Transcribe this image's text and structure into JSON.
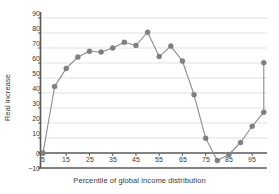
{
  "chart_data": {
    "type": "line",
    "title": "",
    "xlabel": "Percentile of global income distribution",
    "ylabel": "Real increase",
    "xlim": [
      3,
      102
    ],
    "ylim": [
      -10,
      90
    ],
    "yticks": [
      90,
      80,
      70,
      60,
      50,
      40,
      30,
      20,
      10,
      0,
      -10
    ],
    "ytick_labels": [
      "90",
      "80",
      "70",
      "60",
      "50",
      "40",
      "30",
      "20",
      "10",
      "0",
      "−10"
    ],
    "xticks": [
      5,
      15,
      25,
      35,
      45,
      55,
      65,
      75,
      85,
      95
    ],
    "xtick_labels": [
      "5",
      "15",
      "25",
      "35",
      "45",
      "55",
      "65",
      "75",
      "85",
      "95"
    ],
    "grid": "horizontal",
    "legend": "none",
    "markers": "filled-circle",
    "series": [
      {
        "name": "Real income increase",
        "x": [
          5,
          10,
          15,
          20,
          25,
          30,
          35,
          40,
          45,
          50,
          55,
          60,
          65,
          70,
          75,
          80,
          85,
          90,
          95,
          100,
          100
        ],
        "values": [
          0,
          44.3,
          56.4,
          64.0,
          67.8,
          67.3,
          70.0,
          73.8,
          71.7,
          80.5,
          64.3,
          71.3,
          61.3,
          38.8,
          9.8,
          -5.0,
          -1.0,
          7.0,
          17.8,
          27.2,
          60.2
        ]
      }
    ],
    "colors": {
      "line": "#8c8c8c",
      "marker": "#808080",
      "grid": "#d9d9d9",
      "axis": "#595959",
      "text": "#3a3a3a",
      "background": "#ffffff"
    }
  }
}
